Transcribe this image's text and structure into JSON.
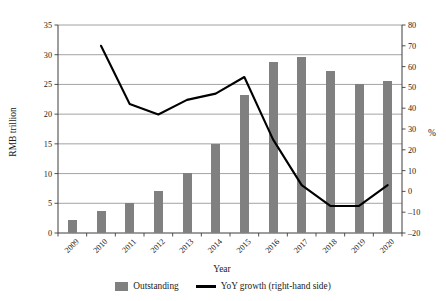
{
  "chart_data": {
    "type": "bar",
    "title": "",
    "xlabel": "Year",
    "ylabel": "RMB trillion",
    "y2label": "%",
    "categories": [
      "2009",
      "2010",
      "2011",
      "2012",
      "2013",
      "2014",
      "2015",
      "2016",
      "2017",
      "2018",
      "2019",
      "2020"
    ],
    "ylim": [
      0,
      35
    ],
    "y2lim": [
      -20,
      80
    ],
    "yticks": [
      "0",
      "5",
      "10",
      "15",
      "20",
      "25",
      "30",
      "35"
    ],
    "y2ticks": [
      "-20",
      "-10",
      "0",
      "10",
      "20",
      "30",
      "40",
      "50",
      "60",
      "70",
      "80"
    ],
    "grid": true,
    "legend_position": "bottom",
    "series": [
      {
        "name": "Outstanding",
        "type": "bar",
        "axis": "left",
        "color": "#808080",
        "values": [
          2.2,
          3.7,
          5.1,
          7.0,
          10.1,
          14.9,
          23.2,
          28.8,
          29.6,
          27.3,
          25.0,
          25.6
        ]
      },
      {
        "name": "YoY growth (right-hand side)",
        "type": "line",
        "axis": "right",
        "color": "#000000",
        "values": [
          null,
          70,
          42,
          37,
          44,
          47,
          55,
          25,
          3,
          -7,
          -7,
          3
        ]
      }
    ]
  },
  "legend": {
    "items": [
      {
        "label": "Outstanding",
        "marker": "bar-swatch",
        "color": "#808080"
      },
      {
        "label": "YoY growth (right-hand side)",
        "marker": "line-swatch",
        "color": "#000000"
      }
    ]
  }
}
